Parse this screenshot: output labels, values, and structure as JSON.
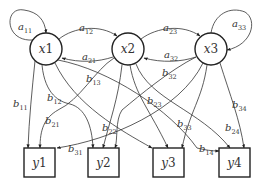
{
  "diagram": {
    "title": "",
    "state_nodes": [
      {
        "id": "x1",
        "label_var": "x",
        "label_num": "1",
        "cx": 46,
        "cy": 49,
        "r": 16
      },
      {
        "id": "x2",
        "label_var": "x",
        "label_num": "2",
        "cx": 128,
        "cy": 49,
        "r": 16
      },
      {
        "id": "x3",
        "label_var": "x",
        "label_num": "3",
        "cx": 211,
        "cy": 49,
        "r": 16
      }
    ],
    "output_nodes": [
      {
        "id": "y1",
        "label_var": "y",
        "label_num": "1",
        "x": 24,
        "y": 148,
        "w": 31,
        "h": 29
      },
      {
        "id": "y2",
        "label_var": "y",
        "label_num": "2",
        "x": 88,
        "y": 148,
        "w": 31,
        "h": 29
      },
      {
        "id": "y3",
        "label_var": "y",
        "label_num": "3",
        "x": 153,
        "y": 148,
        "w": 31,
        "h": 29
      },
      {
        "id": "y4",
        "label_var": "y",
        "label_num": "4",
        "x": 219,
        "y": 148,
        "w": 31,
        "h": 29
      }
    ],
    "edges": [
      {
        "id": "a11",
        "from": "x1",
        "to": "x1",
        "var": "a",
        "sub": "11",
        "path": "M 33 40 C 4 42, 4 6, 24 10 C 38 12, 45 20, 46 33",
        "lx": 18,
        "ly": 30
      },
      {
        "id": "a12",
        "from": "x1",
        "to": "x2",
        "var": "a",
        "sub": "12",
        "path": "M 59 39 C 74 27, 100 24, 117 36",
        "lx": 79,
        "ly": 31
      },
      {
        "id": "a21",
        "from": "x2",
        "to": "x1",
        "var": "a",
        "sub": "21",
        "path": "M 113 57 C 98 62, 80 63, 62 58",
        "lx": 82,
        "ly": 60
      },
      {
        "id": "a23",
        "from": "x2",
        "to": "x3",
        "var": "a",
        "sub": "23",
        "path": "M 141 39 C 157 27, 183 24, 200 36",
        "lx": 163,
        "ly": 31
      },
      {
        "id": "a32",
        "from": "x3",
        "to": "x2",
        "var": "a",
        "sub": "32",
        "path": "M 196 57 C 181 62, 162 63, 144 58",
        "lx": 164,
        "ly": 58
      },
      {
        "id": "a33",
        "from": "x3",
        "to": "x3",
        "var": "a",
        "sub": "33",
        "path": "M 211 33 C 214 14, 230 6, 245 12 C 258 20, 252 45, 227 50",
        "lx": 232,
        "ly": 27
      },
      {
        "id": "b11",
        "from": "x1",
        "to": "y1",
        "var": "b",
        "sub": "11",
        "path": "M 35 61 C 32 90, 29 120, 28 148",
        "lx": 13,
        "ly": 107
      },
      {
        "id": "b12",
        "from": "x1",
        "to": "y2",
        "var": "b",
        "sub": "12",
        "path": "M 42 65 C 45 95, 60 102, 70 104 C 85 108, 92 125, 93 148",
        "lx": 47,
        "ly": 101
      },
      {
        "id": "b13",
        "from": "x1",
        "to": "y3",
        "var": "b",
        "sub": "13",
        "path": "M 55 63 C 75 105, 120 130, 152 148",
        "lx": 86,
        "ly": 82
      },
      {
        "id": "b14",
        "from": "x1",
        "to": "y4",
        "var": "b",
        "sub": "14",
        "path": "M 58 60 C 110 70, 170 110, 197 148 C 205 150, 212 151, 219 151",
        "lx": 199,
        "ly": 152
      },
      {
        "id": "b21",
        "from": "x2",
        "to": "y1",
        "var": "b",
        "sub": "21",
        "path": "M 114 58 C 95 70, 80 100, 58 110 C 44 118, 40 130, 40 148",
        "lx": 45,
        "ly": 124
      },
      {
        "id": "b22",
        "from": "x2",
        "to": "y2",
        "var": "b",
        "sub": "22",
        "path": "M 122 65 C 118 100, 110 120, 103 148",
        "lx": 102,
        "ly": 131
      },
      {
        "id": "b23",
        "from": "x2",
        "to": "y3",
        "var": "b",
        "sub": "23",
        "path": "M 130 65 C 135 95, 150 110, 168 148",
        "lx": 147,
        "ly": 104
      },
      {
        "id": "b24",
        "from": "x2",
        "to": "y4",
        "var": "b",
        "sub": "24",
        "path": "M 136 64 C 150 100, 200 110, 230 148",
        "lx": 225,
        "ly": 131
      },
      {
        "id": "b31",
        "from": "x3",
        "to": "y1",
        "var": "b",
        "sub": "31",
        "path": "M 203 63 C 180 110, 110 140, 57 148",
        "lx": 68,
        "ly": 152
      },
      {
        "id": "b32",
        "from": "x3",
        "to": "y2",
        "var": "b",
        "sub": "32",
        "path": "M 196 57 C 170 70, 140 95, 122 110 C 115 120, 118 140, 115 148",
        "lx": 162,
        "ly": 76
      },
      {
        "id": "b33",
        "from": "x3",
        "to": "y3",
        "var": "b",
        "sub": "33",
        "path": "M 207 65 C 202 100, 190 110, 182 148",
        "lx": 177,
        "ly": 127
      },
      {
        "id": "b34",
        "from": "x3",
        "to": "y4",
        "var": "b",
        "sub": "34",
        "path": "M 220 63 C 230 95, 240 120, 244 148",
        "lx": 232,
        "ly": 108
      }
    ],
    "colors": {
      "stroke": "#333333",
      "node_stroke": "#222222",
      "text": "#333333",
      "background": "#ffffff"
    }
  }
}
